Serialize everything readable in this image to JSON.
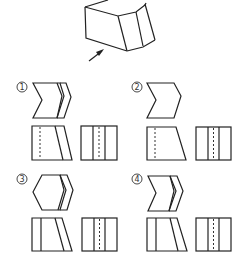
{
  "figure": {
    "object": {
      "name": "prism-solid",
      "view_arrow": "front-direction-arrow"
    },
    "options": [
      {
        "label": "1",
        "glyph": "①",
        "top_view": "double-chevron",
        "front_view": "rect-with-slant-and-dash",
        "side_view": "rect-two-lines-dash"
      },
      {
        "label": "2",
        "glyph": "②",
        "top_view": "single-chevron",
        "front_view": "trapezoid-with-dash",
        "side_view": "rect-two-lines-dash"
      },
      {
        "label": "3",
        "glyph": "③",
        "top_view": "double-hexagon",
        "front_view": "rect-line-and-slant",
        "side_view": "rect-two-lines-dash"
      },
      {
        "label": "4",
        "glyph": "④",
        "top_view": "double-chevron",
        "front_view": "rect-line-and-slant",
        "side_view": "rect-two-lines-dash"
      }
    ]
  },
  "colors": {
    "stroke": "#222222",
    "background": "#ffffff"
  }
}
